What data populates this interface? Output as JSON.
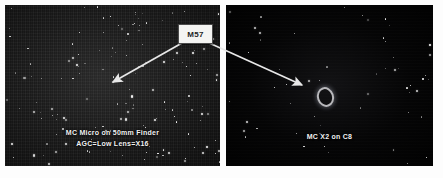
{
  "figure": {
    "name": "m57-two-telescope-comparison",
    "background_color": "#fdfdfd"
  },
  "annotation": {
    "label": "M57",
    "label_box_color": "#f4f4f2",
    "label_text_color": "#1e1e1e",
    "arrow_color": "#e8e8e8",
    "arrows": [
      {
        "name": "arrow-to-left-panel",
        "from_x": 182,
        "from_y": 43,
        "to_x": 113,
        "to_y": 82
      },
      {
        "name": "arrow-to-right-panel",
        "from_x": 207,
        "from_y": 42,
        "to_x": 302,
        "to_y": 85
      }
    ]
  },
  "panels": [
    {
      "name": "panel-left",
      "caption_line1": "MC Micro on 50mm Finder",
      "caption_line2": "AGC=Low  Lens=X16",
      "background_color": "#1b1b1b",
      "caption_color": "#f2f2f2"
    },
    {
      "name": "panel-right",
      "caption_line1": "MC X2 on C8",
      "caption_line2": "",
      "background_color": "#040404",
      "caption_color": "#f2f2f2"
    }
  ],
  "objects": {
    "ring_nebula_name": "M57 ring nebula"
  }
}
